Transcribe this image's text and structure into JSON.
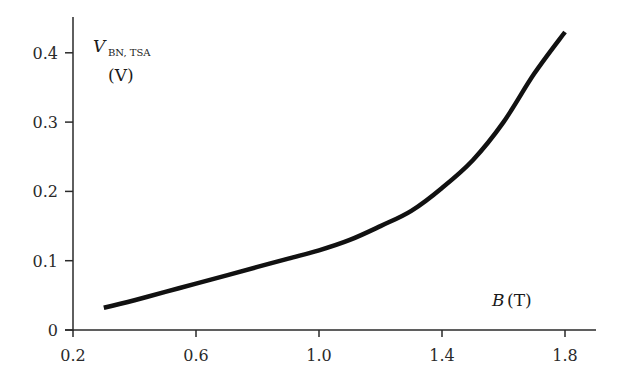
{
  "chart_data": {
    "type": "line",
    "title": "",
    "xlabel": "B (T)",
    "xlabel_var": "B",
    "xlabel_unit": "(T)",
    "ylabel": "V_BN, TSA (V)",
    "ylabel_var": "V",
    "ylabel_sub": "BN, TSA",
    "ylabel_unit": "(V)",
    "xlim": [
      0.2,
      1.9
    ],
    "ylim": [
      0,
      0.44
    ],
    "xticks": [
      "0.2",
      "0.6",
      "1.0",
      "1.4",
      "1.8"
    ],
    "yticks": [
      "0",
      "0.1",
      "0.2",
      "0.3",
      "0.4"
    ],
    "grid": false,
    "legend": null,
    "series": [
      {
        "name": "V_BN,TSA",
        "color": "#111111",
        "x": [
          0.3,
          0.4,
          0.5,
          0.6,
          0.7,
          0.8,
          0.9,
          1.0,
          1.1,
          1.2,
          1.3,
          1.4,
          1.5,
          1.6,
          1.7,
          1.8
        ],
        "y": [
          0.032,
          0.043,
          0.055,
          0.067,
          0.079,
          0.091,
          0.103,
          0.115,
          0.13,
          0.15,
          0.172,
          0.205,
          0.245,
          0.3,
          0.37,
          0.43
        ]
      }
    ]
  },
  "layout": {
    "axis_color": "#2a2a2a",
    "line_color": "#111111"
  }
}
